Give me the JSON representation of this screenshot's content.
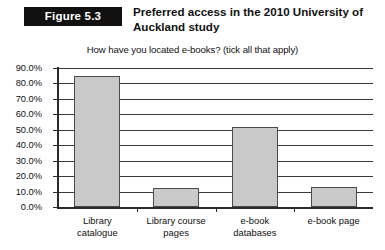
{
  "header": {
    "badge_label": "Figure 5.3",
    "title": "Preferred access in the 2010 University of Auckland study"
  },
  "chart_data": {
    "type": "bar",
    "title": "Preferred access in the 2010 University of Auckland study",
    "subtitle": "How have you located e-books? (tick all that apply)",
    "categories": [
      "Library catalogue",
      "Library course pages",
      "e-book databases",
      "e-book page"
    ],
    "category_lines": [
      "Library\ncatalogue",
      "Library course\npages",
      "e-book\ndatabases",
      "e-book page"
    ],
    "values": [
      85.0,
      12.0,
      52.0,
      13.0
    ],
    "value_labels": [
      "85.0%",
      "12.0%",
      "52.0%",
      "13.0%"
    ],
    "xlabel": "",
    "ylabel": "",
    "ylim": [
      0,
      90
    ],
    "ytick_step": 10,
    "ytick_labels": [
      "90.0%",
      "80.0%",
      "70.0%",
      "60.0%",
      "50.0%",
      "40.0%",
      "30.0%",
      "20.0%",
      "10.0%",
      "0.0%"
    ],
    "ytick_values": [
      90,
      80,
      70,
      60,
      50,
      40,
      30,
      20,
      10,
      0
    ],
    "grid": true,
    "grid_axis": "y",
    "legend": false,
    "legend_position": "none",
    "colors": {
      "bar_fill": "#c9c9c9",
      "bar_border": "#4a4a4a",
      "gridline": "#3a3a3a",
      "axis": "#2a2a2a",
      "text": "#111111",
      "badge_background": "#111111",
      "badge_text": "#ffffff",
      "background": "#ffffff"
    }
  }
}
